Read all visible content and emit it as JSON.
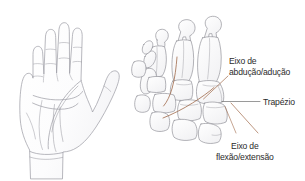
{
  "page": {
    "background_color": "#ffffff",
    "width": 305,
    "height": 181
  },
  "illustration": {
    "title": "",
    "type": "anatomical-line-drawing",
    "left_figure": {
      "name": "palmar-view-hand-outline",
      "description": "Line drawing of an open hand, palmar (palm) view, showing fingers, thumb, palm creases and wrist",
      "stroke_color": "#9a9aa2",
      "fill_color": "#fdfdfd"
    },
    "right_figure": {
      "name": "carpal-metacarpal-skeleton",
      "description": "Skeletal drawing of the carpal bones, metacarpals and proximal phalanges of the thumb side of the hand",
      "stroke_color": "#8b8b93",
      "fill_color": "#fbfbfb"
    }
  },
  "annotations": {
    "accent_color": "#a06a4a",
    "leader_color_gray": "#6f6f6f",
    "text_color": "#2b2b2b",
    "items": [
      {
        "id": "abduction-adduction-axis",
        "line1": "Eixo de",
        "line2": "abdução/adução",
        "leader": "brown-diagonal",
        "target": "second-metacarpal-base"
      },
      {
        "id": "trapezium",
        "line1": "Trapézio",
        "line2": "",
        "leader": "gray-horizontal",
        "target": "trapezium-bone"
      },
      {
        "id": "flexion-extension-axis",
        "line1": "Eixo de",
        "line2": "flexão/extensão",
        "leader": "brown-diagonal",
        "target": "first-carpometacarpal-joint"
      }
    ]
  }
}
